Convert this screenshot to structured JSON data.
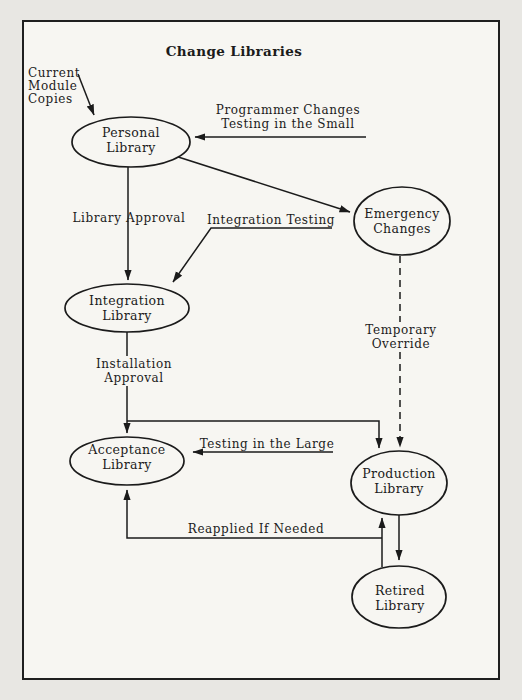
{
  "title": "Change Libraries",
  "nodes": {
    "personal": {
      "line1": "Personal",
      "line2": "Library"
    },
    "integration": {
      "line1": "Integration",
      "line2": "Library"
    },
    "acceptance": {
      "line1": "Acceptance",
      "line2": "Library"
    },
    "emergency": {
      "line1": "Emergency",
      "line2": "Changes"
    },
    "production": {
      "line1": "Production",
      "line2": "Library"
    },
    "retired": {
      "line1": "Retired",
      "line2": "Library"
    }
  },
  "labels": {
    "current_module_copies": {
      "line1": "Current",
      "line2": "Module",
      "line3": "Copies"
    },
    "programmer_changes": {
      "line1": "Programmer Changes",
      "line2": "Testing in the Small"
    },
    "library_approval": "Library Approval",
    "integration_testing": "Integration Testing",
    "installation_approval": {
      "line1": "Installation",
      "line2": "Approval"
    },
    "testing_in_the_large": "Testing in the Large",
    "temporary_override": {
      "line1": "Temporary",
      "line2": "Override"
    },
    "reapplied_if_needed": "Reapplied If Needed"
  },
  "edges": [
    {
      "from": "Current Module Copies",
      "to": "Personal Library",
      "style": "solid"
    },
    {
      "from": "Programmer Changes Testing in the Small",
      "to": "Personal Library",
      "style": "solid"
    },
    {
      "from": "Personal Library",
      "to": "Integration Library",
      "label": "Library Approval",
      "style": "solid"
    },
    {
      "from": "Personal Library",
      "to": "Emergency Changes",
      "style": "solid"
    },
    {
      "from": "Integration Testing",
      "to": "Integration Library",
      "style": "solid"
    },
    {
      "from": "Integration Library",
      "to": "Acceptance Library",
      "label": "Installation Approval",
      "style": "solid"
    },
    {
      "from": "Integration Library",
      "to": "Production Library",
      "style": "solid"
    },
    {
      "from": "Testing in the Large",
      "to": "Acceptance Library",
      "style": "solid"
    },
    {
      "from": "Emergency Changes",
      "to": "Production Library",
      "label": "Temporary Override",
      "style": "dashed"
    },
    {
      "from": "Production Library",
      "to": "Retired Library",
      "style": "solid"
    },
    {
      "from": "Retired Library",
      "to": "Production Library",
      "style": "solid"
    },
    {
      "from": "Production Library",
      "to": "Acceptance Library",
      "label": "Reapplied If Needed",
      "style": "solid"
    }
  ],
  "colors": {
    "ink": "#1b1b1b",
    "paper": "#f7f6f2",
    "page_background": "#e8e7e3"
  }
}
